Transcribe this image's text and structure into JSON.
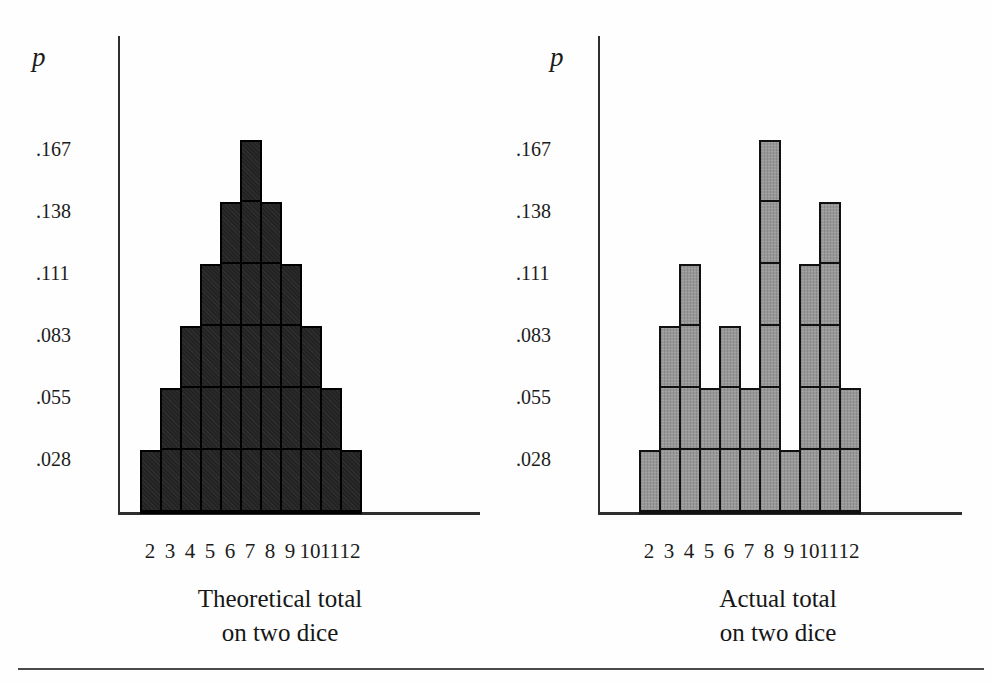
{
  "figure": {
    "description_note": "",
    "accent_colors": {
      "theoretical_bar_fill": "#232323",
      "actual_bar_fill": "#989898",
      "bar_border": "#000000",
      "axis_color": "#2e2e2e"
    }
  },
  "charts": [
    {
      "name": "theoretical",
      "p_label": "p",
      "title_line1": "Theoretical total",
      "title_line2": "on two dice",
      "bar_fill": "#232323",
      "bar_border": "#000000",
      "halftone": false
    },
    {
      "name": "actual",
      "p_label": "p",
      "title_line1": "Actual total",
      "title_line2": "on two dice",
      "bar_fill": "#989898",
      "bar_border": "#111111",
      "halftone": true
    }
  ],
  "chart_data": [
    {
      "type": "bar",
      "title": "Theoretical total on two dice",
      "xlabel": "Theoretical total on two dice",
      "ylabel": "p",
      "categories": [
        "2",
        "3",
        "4",
        "5",
        "6",
        "7",
        "8",
        "9",
        "10",
        "11",
        "12"
      ],
      "values": [
        0.028,
        0.055,
        0.083,
        0.111,
        0.138,
        0.167,
        0.138,
        0.111,
        0.083,
        0.055,
        0.028
      ],
      "unit_counts": [
        1,
        2,
        3,
        4,
        5,
        6,
        5,
        4,
        3,
        2,
        1
      ],
      "unit_probability": 0.028,
      "ytick_labels": [
        ".028",
        ".055",
        ".083",
        ".111",
        ".138",
        ".167"
      ],
      "ytick_values": [
        0.028,
        0.055,
        0.083,
        0.111,
        0.138,
        0.167
      ],
      "ylim": [
        0,
        0.185
      ],
      "grid": "unit-blocks",
      "legend": "none"
    },
    {
      "type": "bar",
      "title": "Actual total on two dice",
      "xlabel": "Actual total on two dice",
      "ylabel": "p",
      "categories": [
        "2",
        "3",
        "4",
        "5",
        "6",
        "7",
        "8",
        "9",
        "10",
        "11",
        "12"
      ],
      "values": [
        0.028,
        0.083,
        0.111,
        0.055,
        0.083,
        0.055,
        0.167,
        0.028,
        0.111,
        0.138,
        0.055
      ],
      "unit_counts": [
        1,
        3,
        4,
        2,
        3,
        2,
        6,
        1,
        4,
        5,
        2
      ],
      "unit_probability": 0.028,
      "ytick_labels": [
        ".028",
        ".055",
        ".083",
        ".111",
        ".138",
        ".167"
      ],
      "ytick_values": [
        0.028,
        0.055,
        0.083,
        0.111,
        0.138,
        0.167
      ],
      "ylim": [
        0,
        0.185
      ],
      "grid": "unit-blocks",
      "legend": "none"
    }
  ]
}
